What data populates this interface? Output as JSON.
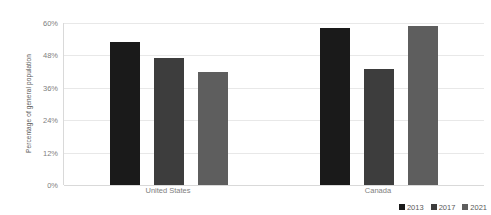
{
  "chart_data": {
    "type": "bar",
    "title": "",
    "subtitle": "",
    "xlabel": "",
    "ylabel": "Percentage of general population",
    "categories": [
      "United States",
      "Canada"
    ],
    "series": [
      {
        "name": "2013",
        "color": "#1a1a1a",
        "values": [
          53,
          58
        ]
      },
      {
        "name": "2017",
        "color": "#3d3d3d",
        "values": [
          47,
          43
        ]
      },
      {
        "name": "2021",
        "color": "#5e5e5e",
        "values": [
          42,
          59
        ]
      }
    ],
    "ylim": [
      0,
      60
    ],
    "ytick_values": [
      0,
      12,
      24,
      36,
      48,
      60
    ],
    "ytick_labels": [
      "0%",
      "12%",
      "24%",
      "36%",
      "48%",
      "60%"
    ],
    "grid": true,
    "grid_axis": "y",
    "legend_position": "bottom-right",
    "legend_orientation": "horizontal",
    "background_color": "#ffffff",
    "gridline_color": "#e8e8e8",
    "axis_color": "#d9d9d9",
    "tick_label_color": "#808080",
    "axis_title_color": "#595959"
  }
}
